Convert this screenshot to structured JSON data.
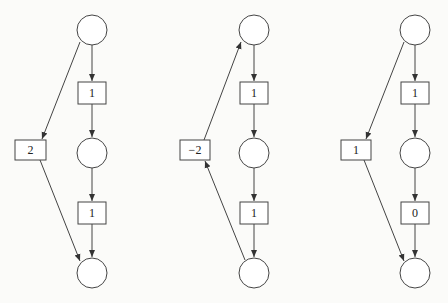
{
  "diagram": {
    "type": "signal-flow-graphs",
    "graphs": [
      {
        "id": "graph-1",
        "places": [
          {
            "id": "top",
            "cx": 92,
            "cy": 30
          },
          {
            "id": "mid",
            "cx": 92,
            "cy": 153
          },
          {
            "id": "bottom",
            "cx": 92,
            "cy": 273
          }
        ],
        "transitions": [
          {
            "id": "upper",
            "x": 78,
            "y": 82,
            "label": "1"
          },
          {
            "id": "lower",
            "x": 78,
            "y": 202,
            "label": "1"
          },
          {
            "id": "side",
            "x": 15,
            "y": 140,
            "label": "2"
          }
        ],
        "side_direction": "down"
      },
      {
        "id": "graph-2",
        "places": [
          {
            "id": "top",
            "cx": 254,
            "cy": 30
          },
          {
            "id": "mid",
            "cx": 254,
            "cy": 153
          },
          {
            "id": "bottom",
            "cx": 254,
            "cy": 273
          }
        ],
        "transitions": [
          {
            "id": "upper",
            "x": 240,
            "y": 82,
            "label": "1"
          },
          {
            "id": "lower",
            "x": 240,
            "y": 202,
            "label": "1"
          },
          {
            "id": "side",
            "x": 180,
            "y": 140,
            "label": "−2"
          }
        ],
        "side_direction": "up"
      },
      {
        "id": "graph-3",
        "places": [
          {
            "id": "top",
            "cx": 415,
            "cy": 30
          },
          {
            "id": "mid",
            "cx": 415,
            "cy": 153
          },
          {
            "id": "bottom",
            "cx": 415,
            "cy": 273
          }
        ],
        "transitions": [
          {
            "id": "upper",
            "x": 401,
            "y": 82,
            "label": "1"
          },
          {
            "id": "lower",
            "x": 401,
            "y": 202,
            "label": "0"
          },
          {
            "id": "side",
            "x": 341,
            "y": 140,
            "label": "1"
          }
        ],
        "side_direction": "down"
      }
    ]
  }
}
